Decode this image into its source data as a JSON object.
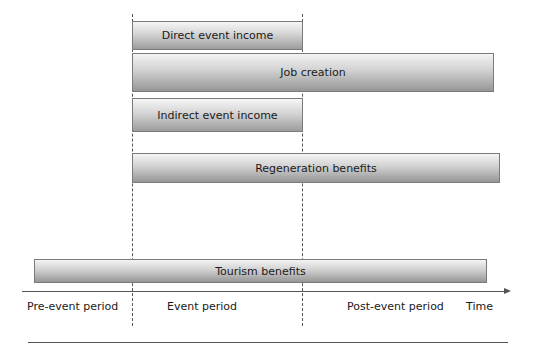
{
  "diagram": {
    "type": "timeline-gantt",
    "bars": [
      {
        "label": "Direct event income",
        "start": "event",
        "end": "event-end"
      },
      {
        "label": "Job creation",
        "start": "event",
        "end": "post-event"
      },
      {
        "label": "Indirect event income",
        "start": "event",
        "end": "event-end"
      },
      {
        "label": "Regeneration benefits",
        "start": "event",
        "end": "post-event"
      },
      {
        "label": "Tourism benefits",
        "start": "pre-event",
        "end": "post-event"
      }
    ],
    "axis": {
      "periods": [
        "Pre-event period",
        "Event period",
        "Post-event period"
      ],
      "axis_label": "Time"
    }
  }
}
